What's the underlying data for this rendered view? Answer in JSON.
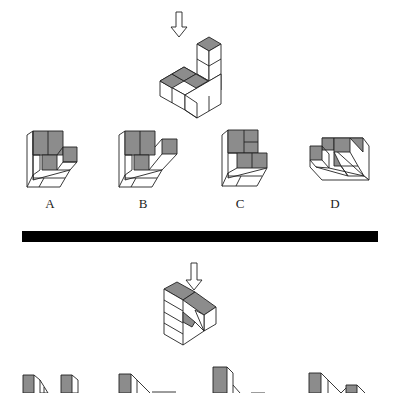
{
  "question1": {
    "view_arrow": "down-arrow-icon",
    "options": [
      {
        "label": "A"
      },
      {
        "label": "B"
      },
      {
        "label": "C"
      },
      {
        "label": "D"
      }
    ]
  },
  "question2": {
    "view_arrow": "down-arrow-icon",
    "options_visible": 4
  },
  "colors": {
    "shaded_face": "#8c8c8c",
    "line": "#222222",
    "divider": "#000000",
    "background": "#ffffff"
  }
}
